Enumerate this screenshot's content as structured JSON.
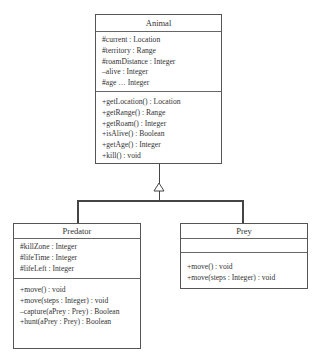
{
  "diagram": {
    "type": "UML class diagram",
    "relationship": "generalization",
    "classes": {
      "animal": {
        "name": "Animal",
        "attributes": [
          "#current : Location",
          "#territory : Range",
          "#roamDistance : Integer",
          "–alive : Integer",
          "#age … Integer"
        ],
        "operations": [
          "+getLocation() : Location",
          "+getRange() : Range",
          "+getRoam() : Integer",
          "+isAlive() : Boolean",
          "+getAge() : Integer",
          "+kill() : void"
        ]
      },
      "predator": {
        "name": "Predator",
        "attributes": [
          "#killZone : Integer",
          "#lifeTime : Integer",
          "#lifeLeft : Integer"
        ],
        "operations": [
          "+move() : void",
          "+move(steps : Integer) : void",
          "–capture(aPrey : Prey) : Boolean",
          "+hunt(aPrey : Prey) : Boolean"
        ]
      },
      "prey": {
        "name": "Prey",
        "attributes": [],
        "operations": [
          "+move() : void",
          "+move(steps : Integer) : void"
        ]
      }
    },
    "edges": [
      {
        "from": "Predator",
        "to": "Animal",
        "kind": "inheritance"
      },
      {
        "from": "Prey",
        "to": "Animal",
        "kind": "inheritance"
      }
    ]
  }
}
